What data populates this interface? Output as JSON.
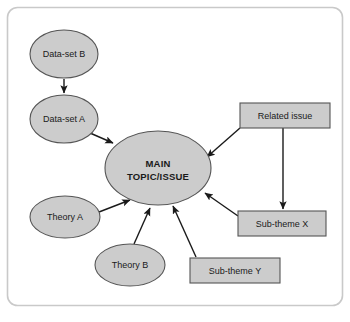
{
  "figure": {
    "type": "concept-map",
    "border": {
      "color": "#c9c9c9",
      "radius": 10
    },
    "palette": {
      "node_fill": "#cccccc",
      "node_stroke": "#555555",
      "arrow_color": "#1a1a1a",
      "text_color": "#1a1a1a",
      "background": "#ffffff"
    }
  },
  "nodes": [
    {
      "id": "data-set-b",
      "label": "Data-set B",
      "shape": "ellipse",
      "cx": 64,
      "cy": 54,
      "rx": 34,
      "ry": 24
    },
    {
      "id": "data-set-a",
      "label": "Data-set A",
      "shape": "ellipse",
      "cx": 64,
      "cy": 119,
      "rx": 34,
      "ry": 24
    },
    {
      "id": "main-topic",
      "label": "MAIN TOPIC/ISSUE",
      "label_lines": [
        "MAIN",
        "TOPIC/ISSUE"
      ],
      "shape": "ellipse",
      "cx": 158,
      "cy": 168,
      "rx": 53,
      "ry": 37
    },
    {
      "id": "theory-a",
      "label": "Theory A",
      "shape": "ellipse",
      "cx": 65,
      "cy": 217,
      "rx": 35,
      "ry": 21
    },
    {
      "id": "theory-b",
      "label": "Theory B",
      "shape": "ellipse",
      "cx": 130,
      "cy": 265,
      "rx": 35,
      "ry": 21
    },
    {
      "id": "related-issue",
      "label": "Related issue",
      "shape": "rect",
      "x": 240,
      "y": 103,
      "w": 90,
      "h": 25
    },
    {
      "id": "sub-theme-x",
      "label": "Sub-theme X",
      "shape": "rect",
      "x": 238,
      "y": 211,
      "w": 88,
      "h": 25
    },
    {
      "id": "sub-theme-y",
      "label": "Sub-theme Y",
      "shape": "rect",
      "x": 190,
      "y": 258,
      "w": 90,
      "h": 25
    }
  ],
  "edges": [
    {
      "id": "edge-dataset-b-to-a",
      "from": "data-set-b",
      "to": "data-set-a"
    },
    {
      "id": "edge-dataset-a-to-main",
      "from": "data-set-a",
      "to": "main-topic"
    },
    {
      "id": "edge-theory-a-to-main",
      "from": "theory-a",
      "to": "main-topic"
    },
    {
      "id": "edge-theory-b-to-main",
      "from": "theory-b",
      "to": "main-topic"
    },
    {
      "id": "edge-related-issue-to-main",
      "from": "related-issue",
      "to": "main-topic"
    },
    {
      "id": "edge-related-issue-to-sub-theme-x",
      "from": "related-issue",
      "to": "sub-theme-x"
    },
    {
      "id": "edge-sub-theme-x-to-main",
      "from": "sub-theme-x",
      "to": "main-topic"
    },
    {
      "id": "edge-sub-theme-y-to-main",
      "from": "sub-theme-y",
      "to": "main-topic"
    }
  ]
}
